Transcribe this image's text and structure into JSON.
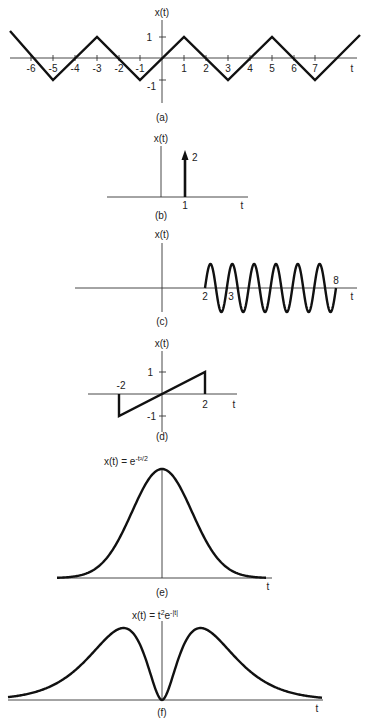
{
  "figure": {
    "panels": [
      {
        "id": "a",
        "caption": "(a)",
        "ylabel": "x(t)",
        "xlabel": "t",
        "xticks": [
          "-6",
          "-5",
          "-4",
          "-3",
          "-2",
          "-1",
          "1",
          "2",
          "3",
          "4",
          "5",
          "6",
          "7"
        ],
        "yticks": [
          "1",
          "-1"
        ]
      },
      {
        "id": "b",
        "caption": "(b)",
        "ylabel": "x(t)",
        "xlabel": "t",
        "xticks": [
          "1"
        ],
        "impulse_label": "2"
      },
      {
        "id": "c",
        "caption": "(c)",
        "ylabel": "x(t)",
        "xlabel": "t",
        "xticks": [
          "2",
          "3",
          "8"
        ]
      },
      {
        "id": "d",
        "caption": "(d)",
        "ylabel": "x(t)",
        "xlabel": "t",
        "xticks": [
          "-2",
          "2"
        ],
        "yticks": [
          "1",
          "-1"
        ]
      },
      {
        "id": "e",
        "caption": "(e)",
        "ylabel": "x(t) = e",
        "ylabel_exp": "-t²/2",
        "xlabel": "t"
      },
      {
        "id": "f",
        "caption": "(f)",
        "ylabel": "x(t) = t",
        "ylabel_exp1": "2",
        "ylabel_mid": "e",
        "ylabel_exp2": "-|t|",
        "xlabel": "t"
      }
    ]
  },
  "chart_data": [
    {
      "type": "line",
      "title": "(a) Triangular wave",
      "ylabel": "x(t)",
      "xlabel": "t",
      "x": [
        -7.3,
        -5,
        -3,
        -1,
        1,
        3,
        5,
        7,
        9
      ],
      "y": [
        1.3,
        -1,
        1,
        -1,
        1,
        -1,
        1,
        -1,
        1
      ],
      "xticks": [
        -6,
        -5,
        -4,
        -3,
        -2,
        -1,
        1,
        2,
        3,
        4,
        5,
        6,
        7
      ],
      "yticks": [
        1,
        -1
      ],
      "period": 4
    },
    {
      "type": "impulse",
      "title": "(b) Impulse",
      "ylabel": "x(t)",
      "xlabel": "t",
      "x": [
        1
      ],
      "y": [
        2
      ],
      "xticks": [
        1
      ],
      "annotation": "2"
    },
    {
      "type": "line",
      "title": "(c) Sinusoid on [2, 8]",
      "ylabel": "x(t)",
      "xlabel": "t",
      "xrange": [
        2,
        8
      ],
      "cycles": 6,
      "period": 1,
      "xticks": [
        2,
        3,
        8
      ]
    },
    {
      "type": "line",
      "title": "(d) Ramp segment",
      "ylabel": "x(t)",
      "xlabel": "t",
      "x": [
        -2,
        -2,
        2,
        2
      ],
      "y": [
        0,
        -1,
        1,
        0
      ],
      "xticks": [
        -2,
        2
      ],
      "yticks": [
        1,
        -1
      ]
    },
    {
      "type": "line",
      "title": "(e) Gaussian",
      "ylabel": "x(t) = e^{-t^2/2}",
      "xlabel": "t",
      "function": "exp(-t^2/2)"
    },
    {
      "type": "line",
      "title": "(f) t^2 e^{-|t|}",
      "ylabel": "x(t) = t^2 e^{-|t|}",
      "xlabel": "t",
      "function": "t^2*exp(-|t|)",
      "peaks_at": [
        -2,
        2
      ]
    }
  ]
}
